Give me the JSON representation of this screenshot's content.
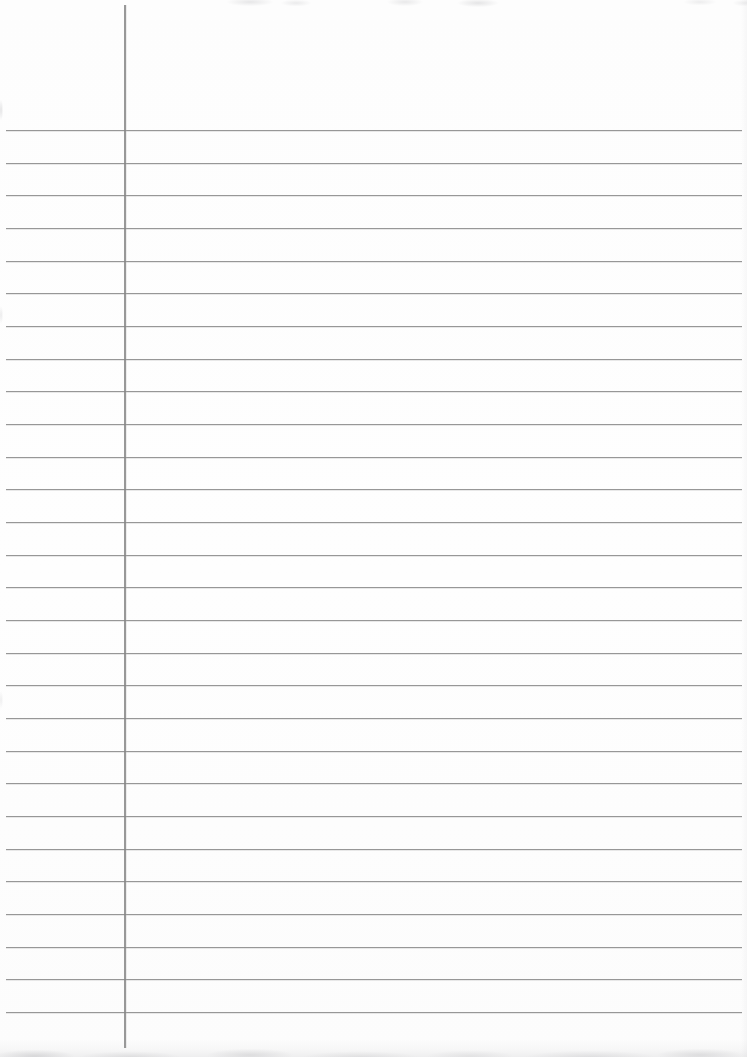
{
  "document": {
    "type": "blank-ruled-notebook-page",
    "visible_text": ""
  },
  "paper": {
    "width_px": 747,
    "height_px": 1057,
    "background_color": "#fdfdfd",
    "edge_band_color": "#e8e8ea"
  },
  "ruling": {
    "horizontal_line_color": "#8f8f8f",
    "horizontal_line_count": 28,
    "first_line_top_px": 130,
    "line_spacing_px": 32.66,
    "line_left_px": 6,
    "line_right_px": 742,
    "margin_line_color": "#878787",
    "margin_line_x_px": 124,
    "margin_line_top_px": 5,
    "margin_line_bottom_px": 1048
  }
}
